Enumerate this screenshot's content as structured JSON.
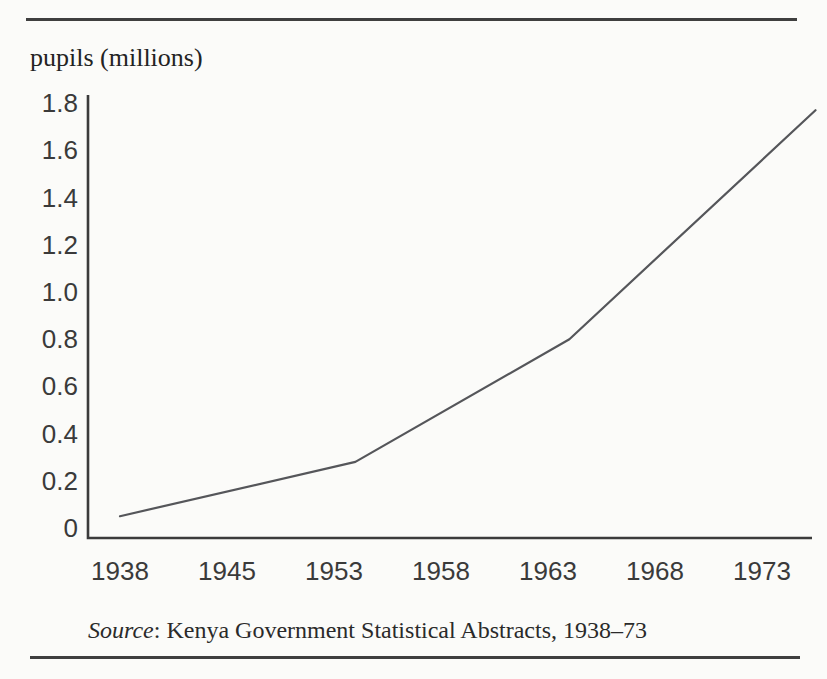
{
  "figure": {
    "y_axis_title": "pupils (millions)",
    "source": {
      "label": "Source",
      "rest": ": Kenya Government Statistical Abstracts, 1938–73"
    }
  },
  "colors": {
    "paper": "#fbfbf9",
    "rule": "#3f3f3f",
    "axis": "#3b3b3b",
    "data_line": "#55565a",
    "tick_text": "#3a3a3a"
  },
  "chart_data": {
    "type": "line",
    "title": "",
    "xlabel": "",
    "ylabel": "pupils (millions)",
    "x_ticks": [
      "1938",
      "1945",
      "1953",
      "1958",
      "1963",
      "1968",
      "1973"
    ],
    "y_ticks": [
      "1.8",
      "1.6",
      "1.4",
      "1.2",
      "1.0",
      "0.8",
      "0.6",
      "0.4",
      "0.2",
      "0"
    ],
    "ylim": [
      0,
      1.8
    ],
    "grid": false,
    "legend": false,
    "series": [
      {
        "name": "pupils (millions)",
        "points": [
          [
            1938,
            0.05
          ],
          [
            1954,
            0.28
          ],
          [
            1964,
            0.8
          ],
          [
            1975.5,
            1.77
          ]
        ]
      }
    ],
    "estimated_values_at_tick_years": {
      "1938": 0.05,
      "1945": 0.15,
      "1953": 0.27,
      "1958": 0.5,
      "1963": 0.75,
      "1968": 1.15,
      "1973": 1.6
    },
    "source": "Source: Kenya Government Statistical Abstracts, 1938–73"
  }
}
